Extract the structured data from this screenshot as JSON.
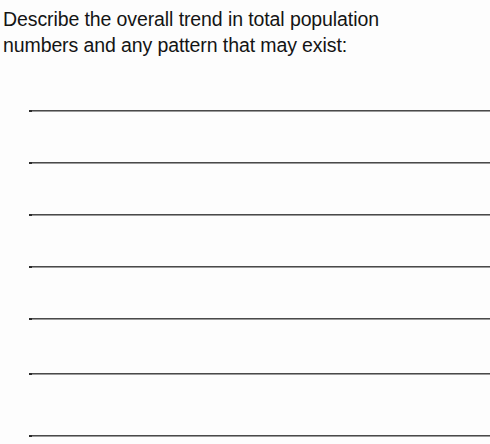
{
  "document": {
    "type": "worksheet-question",
    "background_color": "#fdfdfd",
    "text_color": "#141414",
    "rule_color": "#4a4a4a"
  },
  "prompt": {
    "full_text": "Describe the overall trend in total population\nnumbers and any pattern that may exist:",
    "line_1": "Describe the overall trend in total population",
    "line_2": "numbers and any pattern that may exist:"
  },
  "answer_area": {
    "line_count": 7,
    "lines": [
      {
        "index": 1,
        "y": 110,
        "value": ""
      },
      {
        "index": 2,
        "y": 162,
        "value": ""
      },
      {
        "index": 3,
        "y": 214,
        "value": ""
      },
      {
        "index": 4,
        "y": 266,
        "value": ""
      },
      {
        "index": 5,
        "y": 318,
        "value": ""
      },
      {
        "index": 6,
        "y": 373,
        "value": ""
      },
      {
        "index": 7,
        "y": 435,
        "value": ""
      }
    ]
  }
}
